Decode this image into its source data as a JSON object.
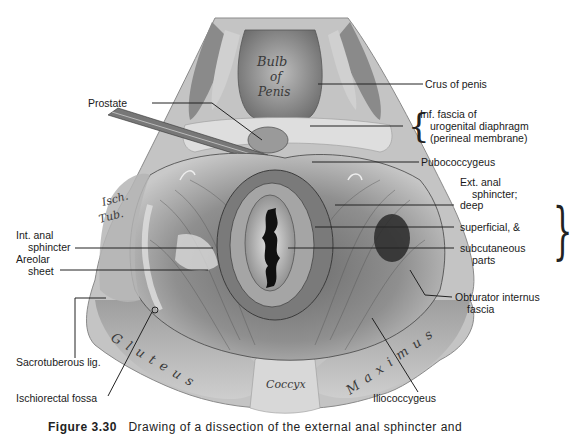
{
  "figure": {
    "caption_number": "Figure 3.30",
    "caption_text": "Drawing of a dissection of the external anal sphincter and",
    "in_image_labels": {
      "bulb": [
        "Bulb",
        "of",
        "Penis"
      ],
      "isch_tub": [
        "Isch.",
        "Tub."
      ],
      "gluteus": "Gluteus",
      "coccyx": "Coccyx",
      "maximus": "Maximus"
    },
    "labels_right": {
      "crus": "Crus of penis",
      "inf_fascia_1": "Inf. fascia of",
      "inf_fascia_2": "urogenital diaphragm",
      "inf_fascia_3": "(perineal membrane)",
      "pubococcygeus": "Pubococcygeus",
      "ext_anal_1": "Ext. anal",
      "ext_anal_2": "sphincter;",
      "deep": "deep",
      "superficial": "superficial, &",
      "subcut_1": "subcutaneous",
      "subcut_2": "parts",
      "obturator_1": "Obturator internus",
      "obturator_2": "fascia",
      "iliococcygeus": "Iliococcygeus"
    },
    "labels_left": {
      "prostate": "Prostate",
      "int_anal_1": "Int. anal",
      "int_anal_2": "sphincter",
      "areolar_1": "Areolar",
      "areolar_2": "sheet",
      "sacrotuberous": "Sacrotuberous lig.",
      "ischiorectal": "Ischiorectal fossa"
    }
  }
}
